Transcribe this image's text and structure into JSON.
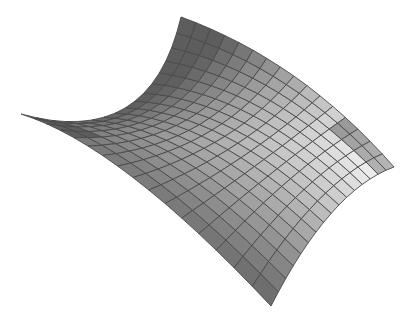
{
  "figure": {
    "title": "Saddle surface (hyperbolic paraboloid) rendered with grid mesh",
    "background": "#ffffff",
    "mesh_color": "#4a4a4a",
    "shade_light": "#f2f2f2",
    "shade_dark": "#3a3a3a",
    "grid": {
      "u_cells": 16,
      "v_cells": 16
    },
    "corners": {
      "top": [
        181,
        17
      ],
      "right": [
        394,
        167
      ],
      "bottom": [
        271,
        306
      ],
      "left": [
        21,
        114
      ]
    },
    "edge_controls": {
      "left_to_top": [
        150,
        150
      ],
      "top_to_right": [
        300,
        60
      ],
      "right_to_bottom": [
        330,
        190
      ],
      "left_to_bottom": [
        120,
        145
      ]
    }
  }
}
